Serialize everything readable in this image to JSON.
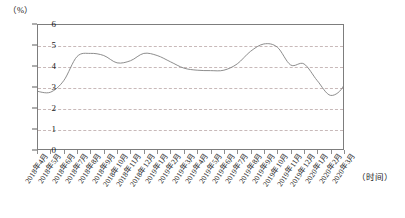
{
  "chart_data": {
    "type": "line",
    "title": "",
    "subtitle": "",
    "xlabel": "（时间）",
    "ylabel": "（%）",
    "ylim": [
      0,
      6
    ],
    "yticks": [
      0,
      1,
      2,
      3,
      4,
      5,
      6
    ],
    "grid": true,
    "legend": "none",
    "line_color": "#808080",
    "categories": [
      "2018年4月",
      "2018年5月",
      "2018年6月",
      "2018年7月",
      "2018年8月",
      "2018年9月",
      "2018年10月",
      "2018年11月",
      "2018年12月",
      "2019年1月",
      "2019年2月",
      "2019年3月",
      "2019年4月",
      "2019年5月",
      "2019年6月",
      "2019年7月",
      "2019年8月",
      "2019年9月",
      "2019年10月",
      "2019年11月",
      "2019年12月",
      "2020年1月",
      "2020年2月",
      "2020年3月"
    ],
    "values": [
      2.8,
      2.75,
      3.3,
      4.45,
      4.6,
      4.5,
      4.15,
      4.25,
      4.6,
      4.5,
      4.2,
      3.9,
      3.8,
      3.78,
      3.8,
      4.1,
      4.7,
      5.05,
      4.9,
      4.05,
      4.1,
      3.3,
      2.6,
      3.1
    ],
    "values_tail": [
      4.4,
      4.35,
      4.3,
      3.4
    ]
  },
  "axis": {
    "y_unit_label": "（%）",
    "x_unit_label": "（时间）",
    "y_tick_labels": [
      "6",
      "5",
      "4",
      "3",
      "2",
      "1",
      "0"
    ]
  }
}
